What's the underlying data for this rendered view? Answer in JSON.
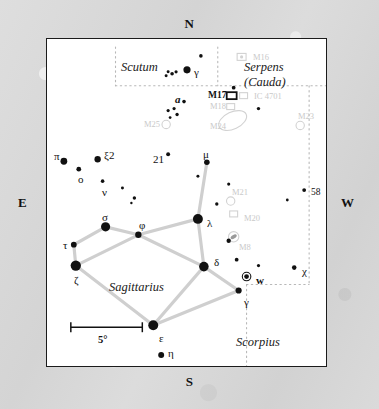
{
  "chart_data": {
    "type": "scatter",
    "xlabel": "",
    "ylabel": "",
    "xlim": [
      0,
      281
    ],
    "ylim": [
      0,
      329
    ],
    "grid": false,
    "legend": "none",
    "scale_bar": {
      "label": "5°",
      "x1": 24,
      "x2": 96,
      "y": 290
    },
    "compass": {
      "north": "N",
      "south": "S",
      "east": "E",
      "west": "W"
    },
    "constellations": [
      {
        "name": "Scutum",
        "x": 74,
        "y": 21,
        "lines": [
          "Scutum"
        ]
      },
      {
        "name": "Serpens (Cauda)",
        "x": 197,
        "y": 21,
        "lines": [
          "Serpens",
          "(Cauda)"
        ]
      },
      {
        "name": "Sagittarius",
        "x": 62,
        "y": 241,
        "lines": [
          "Sagittarius"
        ]
      },
      {
        "name": "Scorpius",
        "x": 189,
        "y": 296,
        "lines": [
          "Scorpius"
        ]
      }
    ],
    "boundaries": [
      {
        "name": "scutum-left-edge",
        "path": "M 69,8 L 69,47"
      },
      {
        "name": "scutum-right-edge",
        "path": "M 172,8 L 172,47"
      },
      {
        "name": "scutum-bottom-edge",
        "path": "M 69,47 L 281,47"
      },
      {
        "name": "serpens-right-edge",
        "path": "M 264,47 L 264,247"
      },
      {
        "name": "scorpius-top-edge",
        "path": "M 201,247 L 264,247"
      },
      {
        "name": "scorpius-left-edge",
        "path": "M 201,247 L 201,329"
      }
    ],
    "asterism_lines": [
      {
        "from": "mu",
        "to": "lambda"
      },
      {
        "from": "lambda",
        "to": "phi"
      },
      {
        "from": "lambda",
        "to": "delta"
      },
      {
        "from": "phi",
        "to": "sigma"
      },
      {
        "from": "phi",
        "to": "delta"
      },
      {
        "from": "sigma",
        "to": "tau"
      },
      {
        "from": "tau",
        "to": "zeta"
      },
      {
        "from": "phi",
        "to": "zeta"
      },
      {
        "from": "zeta",
        "to": "epsilon"
      },
      {
        "from": "delta",
        "to": "epsilon"
      },
      {
        "from": "delta",
        "to": "gamma-sgr"
      },
      {
        "from": "gamma-sgr",
        "to": "epsilon"
      }
    ],
    "stars": [
      {
        "id": "gamma-sct",
        "label": "γ",
        "x": 141,
        "y": 31,
        "r": 3.6,
        "label_dx": 6,
        "label_dy": 3
      },
      {
        "id": "sct-a",
        "label": "",
        "x": 130,
        "y": 33,
        "r": 1.6
      },
      {
        "id": "sct-b",
        "label": "",
        "x": 126,
        "y": 35,
        "r": 1.8
      },
      {
        "id": "sct-c",
        "label": "",
        "x": 122,
        "y": 33,
        "r": 1.5
      },
      {
        "id": "sct-d",
        "label": "",
        "x": 120,
        "y": 37,
        "r": 1.5
      },
      {
        "id": "sct-e",
        "label": "",
        "x": 155,
        "y": 17,
        "r": 1.8
      },
      {
        "id": "m17-star",
        "label": "",
        "x": 188,
        "y": 49,
        "r": 1.9
      },
      {
        "id": "a-sgr",
        "label": "a",
        "x": 138,
        "y": 63,
        "r": 1.8,
        "label_dx": -10,
        "label_dy": -2,
        "style": "ital"
      },
      {
        "id": "clu-1",
        "label": "",
        "x": 128,
        "y": 70,
        "r": 1.6
      },
      {
        "id": "clu-2",
        "label": "",
        "x": 122,
        "y": 72,
        "r": 1.6
      },
      {
        "id": "clu-3",
        "label": "",
        "x": 131,
        "y": 76,
        "r": 1.7
      },
      {
        "id": "clu-4",
        "label": "",
        "x": 124,
        "y": 79,
        "r": 1.4
      },
      {
        "id": "right-1",
        "label": "",
        "x": 213,
        "y": 70,
        "r": 1.7
      },
      {
        "id": "pi",
        "label": "π",
        "x": 17,
        "y": 123,
        "r": 3.4,
        "label_dx": -10,
        "label_dy": -5
      },
      {
        "id": "xi2",
        "label": "ξ2",
        "x": 51,
        "y": 121,
        "r": 3.2,
        "label_dx": 6,
        "label_dy": -4
      },
      {
        "id": "omicron",
        "label": "o",
        "x": 32,
        "y": 131,
        "r": 2.4,
        "label_dx": -1,
        "label_dy": 10
      },
      {
        "id": "nu",
        "label": "ν",
        "x": 56,
        "y": 143,
        "r": 1.8,
        "label_dx": -1,
        "label_dy": 11
      },
      {
        "id": "21-sgr",
        "label": "21",
        "x": 122,
        "y": 116,
        "r": 2.0,
        "label_dx": -16,
        "label_dy": 5
      },
      {
        "id": "mu",
        "label": "μ",
        "x": 161,
        "y": 124,
        "r": 2.8,
        "label_dx": -5,
        "label_dy": -8
      },
      {
        "id": "mu-b",
        "label": "",
        "x": 152,
        "y": 138,
        "r": 1.5
      },
      {
        "id": "fld-1",
        "label": "",
        "x": 76,
        "y": 150,
        "r": 1.5
      },
      {
        "id": "fld-2",
        "label": "",
        "x": 88,
        "y": 160,
        "r": 1.7
      },
      {
        "id": "fld-2b",
        "label": "",
        "x": 85,
        "y": 165,
        "r": 1.2
      },
      {
        "id": "fld-3",
        "label": "",
        "x": 183,
        "y": 146,
        "r": 1.6
      },
      {
        "id": "fld-4",
        "label": "",
        "x": 171,
        "y": 166,
        "r": 1.7
      },
      {
        "id": "star-58",
        "label": "58",
        "x": 259,
        "y": 152,
        "r": 1.9,
        "label_dx": 5,
        "label_dy": 3,
        "style": "small"
      },
      {
        "id": "fld-5",
        "label": "",
        "x": 242,
        "y": 162,
        "r": 1.4
      },
      {
        "id": "sigma",
        "label": "σ",
        "x": 59,
        "y": 189,
        "r": 4.6,
        "label_dx": -4,
        "label_dy": -10
      },
      {
        "id": "phi",
        "label": "φ",
        "x": 92,
        "y": 197,
        "r": 3.2,
        "label_dx": 0,
        "label_dy": -10
      },
      {
        "id": "lambda",
        "label": "λ",
        "x": 152,
        "y": 181,
        "r": 5.0,
        "label_dx": 8,
        "label_dy": 4
      },
      {
        "id": "tau",
        "label": "τ",
        "x": 27,
        "y": 207,
        "r": 2.9,
        "label_dx": -11,
        "label_dy": 0
      },
      {
        "id": "zeta",
        "label": "ζ",
        "x": 29,
        "y": 228,
        "r": 5.2,
        "label_dx": -2,
        "label_dy": 14
      },
      {
        "id": "delta",
        "label": "δ",
        "x": 158,
        "y": 229,
        "r": 4.8,
        "label_dx": 9,
        "label_dy": -5
      },
      {
        "id": "fld-6",
        "label": "",
        "x": 183,
        "y": 203,
        "r": 2.2
      },
      {
        "id": "fld-7",
        "label": "",
        "x": 191,
        "y": 222,
        "r": 1.9
      },
      {
        "id": "fld-8",
        "label": "",
        "x": 213,
        "y": 228,
        "r": 1.6
      },
      {
        "id": "w-sgr",
        "label": "w",
        "x": 201,
        "y": 239,
        "r": 2.4,
        "label_dx": 8,
        "label_dy": 3,
        "style": "bold",
        "ring": true
      },
      {
        "id": "chi",
        "label": "χ",
        "x": 249,
        "y": 230,
        "r": 2.3,
        "label_dx": 6,
        "label_dy": 3
      },
      {
        "id": "gamma-sgr",
        "label": "γ",
        "x": 193,
        "y": 253,
        "r": 3.1,
        "label_dx": 4,
        "label_dy": 11
      },
      {
        "id": "epsilon",
        "label": "ε",
        "x": 107,
        "y": 288,
        "r": 5.0,
        "label_dx": 5,
        "label_dy": 12
      },
      {
        "id": "eta",
        "label": "η",
        "x": 115,
        "y": 318,
        "r": 3.0,
        "label_dx": 6,
        "label_dy": -3
      }
    ],
    "deep_sky_objects": [
      {
        "id": "m16",
        "label": "M16",
        "x": 196,
        "y": 18,
        "shape": "box-cluster",
        "tone": "faint",
        "label_dx": 10,
        "label_dy": 1
      },
      {
        "id": "m17",
        "label": "M17",
        "x": 186,
        "y": 57,
        "shape": "rect",
        "tone": "dark",
        "label_dx": -25,
        "label_dy": 0
      },
      {
        "id": "ic4701",
        "label": "IC 4701",
        "x": 198,
        "y": 57,
        "shape": "square",
        "tone": "faint",
        "label_dx": 9,
        "label_dy": 1
      },
      {
        "id": "m18",
        "label": "M18",
        "x": 185,
        "y": 68,
        "shape": "square",
        "tone": "faint",
        "label_dx": -22,
        "label_dy": 0
      },
      {
        "id": "m24",
        "label": "M24",
        "x": 187,
        "y": 82,
        "shape": "ellipse",
        "tone": "faint",
        "label_dx": -24,
        "label_dy": 6
      },
      {
        "id": "m25",
        "label": "M25",
        "x": 120,
        "y": 86,
        "shape": "circle",
        "tone": "faint",
        "label_dx": -23,
        "label_dy": 0
      },
      {
        "id": "m23",
        "label": "M23",
        "x": 255,
        "y": 87,
        "shape": "circle",
        "tone": "faint",
        "label_dx": -4,
        "label_dy": -9
      },
      {
        "id": "m21",
        "label": "M21",
        "x": 185,
        "y": 163,
        "shape": "circle",
        "tone": "faint",
        "label_dx": 0,
        "label_dy": -9
      },
      {
        "id": "m20",
        "label": "M20",
        "x": 188,
        "y": 176,
        "shape": "square",
        "tone": "faint",
        "label_dx": 9,
        "label_dy": 4
      },
      {
        "id": "m8",
        "label": "M8",
        "x": 188,
        "y": 199,
        "shape": "lagoon",
        "tone": "faint",
        "label_dx": 4,
        "label_dy": 10
      }
    ]
  }
}
